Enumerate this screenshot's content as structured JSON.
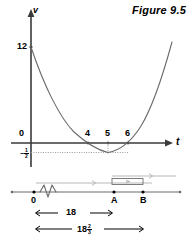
{
  "figure": {
    "title": "Figure 9.5",
    "caption_id": "9.5"
  },
  "graph": {
    "y_axis_label": "v",
    "x_axis_label": "t",
    "origin_label": "0",
    "y_intercept_label": "12",
    "min_value_whole": "",
    "min_value_sign": "−",
    "min_value_num": "1",
    "min_value_den": "2",
    "x_ticks": [
      {
        "label": "4"
      },
      {
        "label": "5"
      },
      {
        "label": "6"
      }
    ]
  },
  "numberline": {
    "point_origin": "0",
    "point_a": "A",
    "point_b": "B"
  },
  "dimensions": {
    "d1_label": "18",
    "d2_whole": "18",
    "d2_num": "2",
    "d2_den": "3"
  },
  "colors": {
    "ink": "#000000",
    "curve": "#555555",
    "axis": "#3a3a3a",
    "dotted": "#8a8a8a",
    "background": "#ffffff"
  }
}
